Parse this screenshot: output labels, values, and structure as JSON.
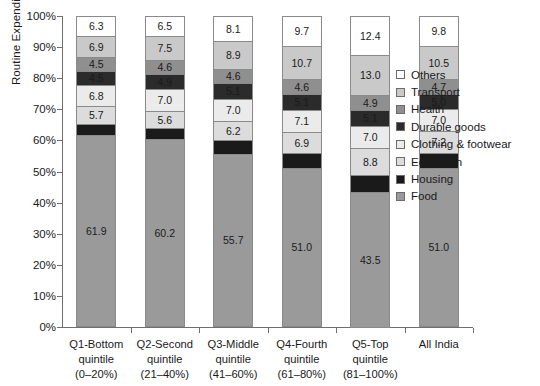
{
  "chart_data": {
    "type": "bar",
    "subtype": "stacked-100-percent",
    "title": "",
    "xlabel": "",
    "ylabel": "Routine Expenditure",
    "ylim": [
      0,
      100
    ],
    "ytick_labels": [
      "100%",
      "90%",
      "80%",
      "70%",
      "60%",
      "50%",
      "40%",
      "30%",
      "20%",
      "10%",
      "0%"
    ],
    "ytick_values": [
      100,
      90,
      80,
      70,
      60,
      50,
      40,
      30,
      20,
      10,
      0
    ],
    "grid": false,
    "legend_position": "right",
    "categories": [
      {
        "line1": "Q1-Bottom",
        "line2": "quintile",
        "line3": "(0–20%)"
      },
      {
        "line1": "Q2-Second",
        "line2": "quintile",
        "line3": "(21–40%)"
      },
      {
        "line1": "Q3-Middle",
        "line2": "quintile",
        "line3": "(41–60%)"
      },
      {
        "line1": "Q4-Fourth",
        "line2": "quintile",
        "line3": "(61–80%)"
      },
      {
        "line1": "Q5-Top",
        "line2": "quintile",
        "line3": "(81–100%)"
      },
      {
        "line1": "All India",
        "line2": "",
        "line3": ""
      }
    ],
    "series": [
      {
        "name": "Others",
        "color": "#ffffff",
        "text_color": "#1a1a1a",
        "values": [
          6.3,
          6.5,
          8.1,
          9.7,
          12.4,
          9.8
        ]
      },
      {
        "name": "Transport",
        "color": "#c9c9c9",
        "text_color": "#1a1a1a",
        "values": [
          6.9,
          7.5,
          8.9,
          10.7,
          13.0,
          10.5
        ]
      },
      {
        "name": "Health",
        "color": "#8f8f8f",
        "text_color": "#1a1a1a",
        "values": [
          4.5,
          4.6,
          4.6,
          4.6,
          4.9,
          4.7
        ]
      },
      {
        "name": "Durable goods",
        "color": "#2b2b2b",
        "text_color": "#1a1a1a",
        "values": [
          4.5,
          4.9,
          5.1,
          5.1,
          5.1,
          5.0
        ]
      },
      {
        "name": "Clothing & footwear",
        "color": "#ebebeb",
        "text_color": "#1a1a1a",
        "values": [
          6.8,
          7.0,
          7.0,
          7.1,
          7.0,
          7.0
        ]
      },
      {
        "name": "Education",
        "color": "#dcdcdc",
        "text_color": "#1a1a1a",
        "values": [
          5.7,
          5.6,
          6.2,
          6.9,
          8.8,
          7.2
        ]
      },
      {
        "name": "Housing",
        "color": "#1a1a1a",
        "text_color": "#1a1a1a",
        "values": [
          3.5,
          3.6,
          4.4,
          4.8,
          5.5,
          4.7
        ]
      },
      {
        "name": "Food",
        "color": "#9a9a9a",
        "text_color": "#1a1a1a",
        "values": [
          61.9,
          60.2,
          55.7,
          51.0,
          43.5,
          51.0
        ]
      }
    ]
  }
}
